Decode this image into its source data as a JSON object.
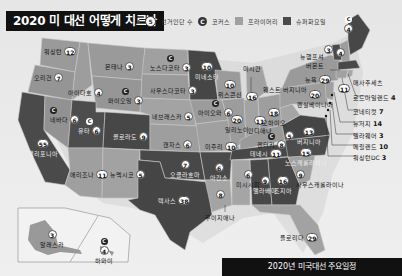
{
  "title": "2020 미 대선 어떻게 치르나",
  "legend": {
    "electoral_votes": "선거인단 수",
    "electoral_votes_sample": "5",
    "caucus": "코커스",
    "caucus_mark": "C",
    "primary": "프라이머리",
    "super_tuesday": "슈퍼화요일"
  },
  "colors": {
    "primary": "#9b9b9b",
    "super_tuesday": "#4a4a4a",
    "caucus_other": "#8a8a8a",
    "background": "#e9e9e9"
  },
  "states": [
    {
      "name": "워싱턴",
      "votes": "12",
      "type": "primary"
    },
    {
      "name": "오리건",
      "votes": "7",
      "type": "primary"
    },
    {
      "name": "캘리포니아",
      "votes": "55",
      "type": "super_tuesday"
    },
    {
      "name": "네바다",
      "votes": "6",
      "type": "caucus"
    },
    {
      "name": "아이다호",
      "votes": "4",
      "type": "primary"
    },
    {
      "name": "몬태나",
      "votes": "3",
      "type": "primary"
    },
    {
      "name": "와이오밍",
      "votes": "3",
      "type": "caucus"
    },
    {
      "name": "유타",
      "votes": "6",
      "type": "caucus_super_tuesday"
    },
    {
      "name": "콜로라도",
      "votes": "9",
      "type": "super_tuesday"
    },
    {
      "name": "애리조나",
      "votes": "11",
      "type": "primary"
    },
    {
      "name": "뉴멕시코",
      "votes": "5",
      "type": "primary"
    },
    {
      "name": "노스다코타",
      "votes": "3",
      "type": "caucus"
    },
    {
      "name": "사우스다코타",
      "votes": "3",
      "type": "primary"
    },
    {
      "name": "네브래스카",
      "votes": "5",
      "type": "primary"
    },
    {
      "name": "캔자스",
      "votes": "6",
      "type": "primary"
    },
    {
      "name": "오클라호마",
      "votes": "7",
      "type": "super_tuesday"
    },
    {
      "name": "텍사스",
      "votes": "38",
      "type": "super_tuesday"
    },
    {
      "name": "미네소타",
      "votes": "10",
      "type": "super_tuesday"
    },
    {
      "name": "아이오와",
      "votes": "6",
      "type": "caucus"
    },
    {
      "name": "미주리",
      "votes": "10",
      "type": "primary"
    },
    {
      "name": "아칸소",
      "votes": "6",
      "type": "super_tuesday"
    },
    {
      "name": "루이지애나",
      "votes": "8",
      "type": "primary"
    },
    {
      "name": "위스콘신",
      "votes": "10",
      "type": "primary"
    },
    {
      "name": "미시간",
      "votes": "16",
      "type": "primary"
    },
    {
      "name": "일리노이",
      "votes": "20",
      "type": "primary"
    },
    {
      "name": "인디애나",
      "votes": "11",
      "type": "primary"
    },
    {
      "name": "오하이오",
      "votes": "18",
      "type": "primary"
    },
    {
      "name": "켄터키",
      "votes": "8",
      "type": "caucus"
    },
    {
      "name": "테네시",
      "votes": "11",
      "type": "super_tuesday"
    },
    {
      "name": "미시시피",
      "votes": "6",
      "type": "primary"
    },
    {
      "name": "앨라배마",
      "votes": "9",
      "type": "super_tuesday"
    },
    {
      "name": "조지아",
      "votes": "16",
      "type": "super_tuesday"
    },
    {
      "name": "플로리다",
      "votes": "29",
      "type": "primary"
    },
    {
      "name": "사우스캐롤라이나",
      "votes": "9",
      "type": "primary"
    },
    {
      "name": "노스캐롤라이나",
      "votes": "15",
      "type": "super_tuesday"
    },
    {
      "name": "버지니아",
      "votes": "13",
      "type": "super_tuesday"
    },
    {
      "name": "웨스트버지니아",
      "votes": "5",
      "type": "primary"
    },
    {
      "name": "펜실베이니아",
      "votes": "20",
      "type": "primary"
    },
    {
      "name": "뉴욕",
      "votes": "29",
      "type": "primary"
    },
    {
      "name": "버몬트",
      "votes": "3",
      "type": "super_tuesday"
    },
    {
      "name": "뉴햄프셔",
      "votes": "4",
      "type": "primary"
    },
    {
      "name": "메인",
      "votes": "4",
      "type": "caucus_super_tuesday"
    },
    {
      "name": "매사추세츠",
      "votes": "11",
      "type": "super_tuesday"
    },
    {
      "name": "로드아일랜드",
      "votes": "4",
      "type": "primary"
    },
    {
      "name": "코네티컷",
      "votes": "7",
      "type": "primary"
    },
    {
      "name": "뉴저지",
      "votes": "14",
      "type": "primary"
    },
    {
      "name": "델라웨어",
      "votes": "3",
      "type": "primary"
    },
    {
      "name": "메릴랜드",
      "votes": "10",
      "type": "primary"
    },
    {
      "name": "워싱턴DC",
      "votes": "3",
      "type": "primary"
    },
    {
      "name": "알래스카",
      "votes": "3",
      "type": "primary"
    },
    {
      "name": "하와이",
      "votes": "4",
      "type": "caucus"
    }
  ],
  "callouts": {
    "michigan": "미시간",
    "west_virginia": "웨스트 버지니아",
    "new_hampshire": "뉴햄프셔",
    "vermont": "버몬트",
    "massachusetts": "매사추세츠",
    "rhode_island": "로드아일랜드",
    "rhode_island_votes": "4",
    "connecticut": "코네티컷",
    "connecticut_votes": "7",
    "new_jersey": "뉴저지",
    "new_jersey_votes": "14",
    "delaware": "델라웨어",
    "delaware_votes": "3",
    "maryland": "메릴랜드",
    "maryland_votes": "10",
    "dc": "워싱턴DC",
    "dc_votes": "3",
    "louisiana": "루이지애나"
  },
  "footer": "2020년 미국대선 주요일정"
}
